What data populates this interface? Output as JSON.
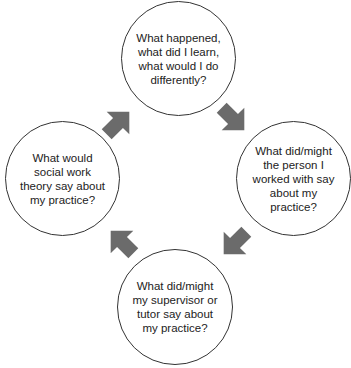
{
  "diagram": {
    "type": "cycle",
    "arrow_color": "#6b6b6b",
    "nodes": [
      {
        "id": "top",
        "label": "What happened,\nwhat did I learn,\nwhat would I do\ndifferently?"
      },
      {
        "id": "right",
        "label": "What did/might\nthe person I\nworked with say\nabout my\npractice?"
      },
      {
        "id": "bottom",
        "label": "What did/might\nmy supervisor or\ntutor say about\nmy practice?"
      },
      {
        "id": "left",
        "label": "What would\nsocial work\ntheory say about\nmy practice?"
      }
    ],
    "arrows": [
      {
        "from": "top",
        "to": "right",
        "direction": "down-right"
      },
      {
        "from": "right",
        "to": "bottom",
        "direction": "down-left"
      },
      {
        "from": "bottom",
        "to": "left",
        "direction": "up-left"
      },
      {
        "from": "left",
        "to": "top",
        "direction": "up-right"
      }
    ]
  }
}
